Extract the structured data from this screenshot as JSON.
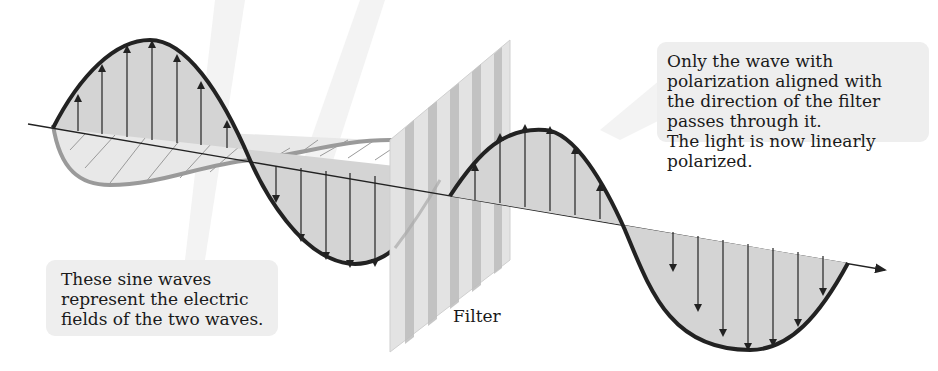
{
  "diagram": {
    "callouts": {
      "right": {
        "lines": [
          "Only the wave with",
          "polarization aligned with",
          "the direction of the filter",
          "passes through it.",
          "The light is now linearly",
          "polarized."
        ]
      },
      "left": {
        "lines": [
          "These sine waves",
          "represent the electric",
          "fields of the two waves."
        ]
      }
    },
    "labels": {
      "filter": "Filter"
    },
    "elements": {
      "vertical_wave": "vertical-sine-wave",
      "horizontal_wave": "horizontal-sine-wave",
      "filter": "polarizing-filter",
      "axis": "propagation-axis-arrow",
      "transmitted_wave": "transmitted-vertical-wave"
    },
    "colors": {
      "background": "#ffffff",
      "callout_bg": "#eeeeee",
      "wave_fill": "#d4d4d4",
      "wave_stroke": "#222222",
      "horizontal_wave_stroke": "#9a9a9a",
      "horizontal_wave_fill": "#e6e6e6",
      "filter_light": "#e2e2e2",
      "filter_dark": "#bdbdbd",
      "text": "#1a1a1a"
    }
  }
}
